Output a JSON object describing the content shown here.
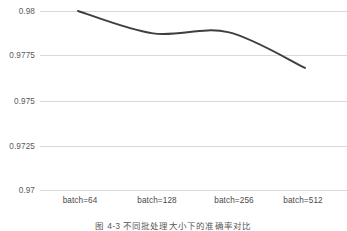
{
  "chart_data": {
    "type": "line",
    "title": "",
    "xlabel": "",
    "ylabel": "",
    "categories": [
      "batch=64",
      "batch=128",
      "batch=256",
      "batch=512"
    ],
    "series": [
      {
        "name": "accuracy",
        "values": [
          0.98,
          0.97875,
          0.97882,
          0.97682
        ],
        "color": "#3f3f3f"
      }
    ],
    "ylim": [
      0.97,
      0.98
    ],
    "yticks": [
      0.97,
      0.9725,
      0.975,
      0.9775,
      0.98
    ],
    "ytick_labels": [
      "0.97",
      "0.9725",
      "0.975",
      "0.9775",
      "0.98"
    ],
    "grid": "horizontal-only",
    "legend": "none",
    "smoothing": "spline"
  },
  "axis": {
    "y_labels": [
      "0.98",
      "0.9775",
      "0.975",
      "0.9725",
      "0.97"
    ],
    "x_labels": [
      "batch=64",
      "batch=128",
      "batch=256",
      "batch=512"
    ]
  },
  "caption": {
    "text": "图 4-3  不同批处理大小下的准确率对比"
  },
  "style": {
    "grid_color": "#d9d9d9",
    "line_color": "#3f3f3f",
    "label_color": "#5b5b5b",
    "background": "#ffffff"
  }
}
